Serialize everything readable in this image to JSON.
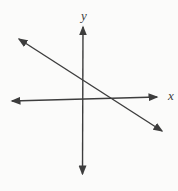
{
  "figure": {
    "type": "coordinate-plane-diagram",
    "x_axis_label": "x",
    "y_axis_label": "y",
    "stroke_color": "#3d3d3d",
    "background": "#fbfbfa",
    "lines": {
      "x_axis": [
        12,
        101,
        157,
        97
      ],
      "y_axis": [
        83,
        27,
        82.5,
        174
      ],
      "oblique": [
        19,
        39,
        162,
        131
      ]
    },
    "label_positions": {
      "x": [
        171,
        100
      ],
      "y": [
        84,
        20
      ]
    }
  }
}
